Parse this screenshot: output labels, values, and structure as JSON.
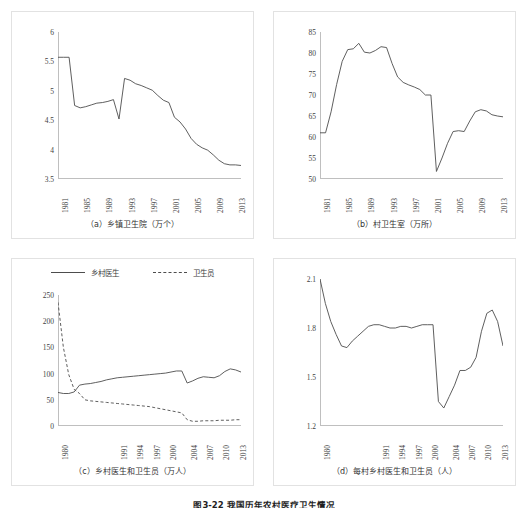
{
  "figure": {
    "caption": "图3-22  我国历年农村医疗卫生情况",
    "panels": [
      "a",
      "b",
      "c",
      "d"
    ]
  },
  "legend": {
    "entries": [
      {
        "label": "乡村医生",
        "style": "solid",
        "swatch": "solid-line-swatch"
      },
      {
        "label": "卫生员",
        "style": "dashed",
        "swatch": "dashed-line-swatch"
      }
    ]
  },
  "chart_data": [
    {
      "id": "a",
      "type": "line",
      "title": "（a）乡镇卫生院（万个）",
      "xlabel": "",
      "ylabel": "",
      "ylim": [
        3.5,
        6
      ],
      "yticks": [
        3.5,
        4,
        4.5,
        5,
        5.5,
        6
      ],
      "ytick_labels": [
        "3.5",
        "4",
        "4.5",
        "5",
        "5.5",
        "6"
      ],
      "grid": false,
      "xlim": [
        1981,
        2014
      ],
      "xticks": [
        1981,
        1985,
        1989,
        1993,
        1997,
        2001,
        2005,
        2009,
        2013
      ],
      "xtick_labels": [
        "1981",
        "1985",
        "1989",
        "1993",
        "1997",
        "2001",
        "2005",
        "2009",
        "2013"
      ],
      "x": [
        1981,
        1982,
        1983,
        1984,
        1985,
        1986,
        1987,
        1988,
        1989,
        1990,
        1991,
        1992,
        1993,
        1994,
        1995,
        1996,
        1997,
        1998,
        1999,
        2000,
        2001,
        2002,
        2003,
        2004,
        2005,
        2006,
        2007,
        2008,
        2009,
        2010,
        2011,
        2012,
        2013,
        2014
      ],
      "series": [
        {
          "name": "乡镇卫生院",
          "style": "solid",
          "values": [
            5.57,
            5.57,
            5.57,
            4.75,
            4.71,
            4.73,
            4.76,
            4.79,
            4.8,
            4.82,
            4.85,
            4.52,
            5.21,
            5.18,
            5.12,
            5.09,
            5.05,
            5.01,
            4.92,
            4.84,
            4.8,
            4.55,
            4.47,
            4.35,
            4.19,
            4.09,
            4.03,
            3.99,
            3.91,
            3.82,
            3.76,
            3.74,
            3.74,
            3.73
          ]
        }
      ]
    },
    {
      "id": "b",
      "type": "line",
      "title": "（b）村卫生室（万所）",
      "xlabel": "",
      "ylabel": "",
      "ylim": [
        50,
        85
      ],
      "yticks": [
        50,
        55,
        60,
        65,
        70,
        75,
        80,
        85
      ],
      "ytick_labels": [
        "50",
        "55",
        "60",
        "65",
        "70",
        "75",
        "80",
        "85"
      ],
      "grid": false,
      "xlim": [
        1981,
        2014
      ],
      "xticks": [
        1981,
        1985,
        1989,
        1993,
        1997,
        2001,
        2005,
        2009,
        2013
      ],
      "xtick_labels": [
        "1981",
        "1985",
        "1989",
        "1993",
        "1997",
        "2001",
        "2005",
        "2009",
        "2013"
      ],
      "x": [
        1981,
        1982,
        1983,
        1984,
        1985,
        1986,
        1987,
        1988,
        1989,
        1990,
        1991,
        1992,
        1993,
        1994,
        1995,
        1996,
        1997,
        1998,
        1999,
        2000,
        2001,
        2002,
        2003,
        2004,
        2005,
        2006,
        2007,
        2008,
        2009,
        2010,
        2011,
        2012,
        2013,
        2014
      ],
      "series": [
        {
          "name": "村卫生室",
          "style": "solid",
          "values": [
            61.0,
            61.0,
            66.0,
            72.5,
            78.0,
            80.8,
            81.0,
            82.3,
            80.2,
            80.0,
            80.6,
            81.5,
            81.3,
            77.5,
            74.3,
            73.0,
            72.4,
            71.9,
            71.3,
            70.0,
            70.0,
            51.8,
            55.0,
            58.5,
            61.3,
            61.5,
            61.3,
            63.8,
            66.0,
            66.5,
            66.2,
            65.3,
            65.0,
            64.8
          ]
        }
      ]
    },
    {
      "id": "c",
      "type": "line",
      "title": "（c）乡村医生和卫生员（万人）",
      "xlabel": "",
      "ylabel": "",
      "ylim": [
        0,
        250
      ],
      "yticks": [
        0,
        50,
        100,
        150,
        200,
        250
      ],
      "ytick_labels": [
        "0",
        "50",
        "100",
        "150",
        "200",
        "250"
      ],
      "grid": false,
      "xlim": [
        1980,
        2014
      ],
      "xticks": [
        1980,
        1991,
        1994,
        1997,
        2000,
        2004,
        2007,
        2010,
        2013
      ],
      "xtick_labels": [
        "1980",
        "1991",
        "1994",
        "1997",
        "2000",
        "2004",
        "2007",
        "2010",
        "2013"
      ],
      "x": [
        1980,
        1981,
        1982,
        1983,
        1984,
        1985,
        1986,
        1987,
        1988,
        1989,
        1990,
        1991,
        1992,
        1993,
        1994,
        1995,
        1996,
        1997,
        1998,
        1999,
        2000,
        2001,
        2002,
        2003,
        2004,
        2005,
        2006,
        2007,
        2008,
        2009,
        2010,
        2011,
        2012,
        2013,
        2014
      ],
      "series": [
        {
          "name": "乡村医生",
          "style": "solid",
          "values": [
            64,
            62,
            62,
            65,
            78,
            80,
            81,
            83,
            85,
            88,
            90,
            92,
            93,
            94,
            95,
            96,
            97,
            98,
            99,
            100,
            101,
            103,
            105,
            105,
            82,
            86,
            91,
            94,
            93,
            92,
            96,
            104,
            109,
            107,
            103
          ]
        },
        {
          "name": "卫生员",
          "style": "dashed",
          "values": [
            236,
            150,
            98,
            70,
            62,
            50,
            48,
            47,
            46,
            45,
            44,
            43,
            42,
            41,
            40,
            39,
            38,
            37,
            35,
            33,
            31,
            29,
            27,
            25,
            12,
            9,
            9,
            10,
            10,
            10,
            11,
            11,
            11,
            12,
            12
          ]
        }
      ]
    },
    {
      "id": "d",
      "type": "line",
      "title": "（d）每村乡村医生和卫生员（人）",
      "xlabel": "",
      "ylabel": "",
      "ylim": [
        1.2,
        2.1
      ],
      "yticks": [
        1.2,
        1.5,
        1.8,
        2.1
      ],
      "ytick_labels": [
        "1.2",
        "1.5",
        "1.8",
        "2.1"
      ],
      "grid": false,
      "xlim": [
        1980,
        2014
      ],
      "xticks": [
        1980,
        1991,
        1994,
        1997,
        2000,
        2004,
        2007,
        2010,
        2013
      ],
      "xtick_labels": [
        "1980",
        "1991",
        "1994",
        "1997",
        "2000",
        "2004",
        "2007",
        "2010",
        "2013"
      ],
      "x": [
        1980,
        1981,
        1982,
        1983,
        1984,
        1985,
        1986,
        1987,
        1988,
        1989,
        1990,
        1991,
        1992,
        1993,
        1994,
        1995,
        1996,
        1997,
        1998,
        1999,
        2000,
        2001,
        2002,
        2003,
        2004,
        2005,
        2006,
        2007,
        2008,
        2009,
        2010,
        2011,
        2012,
        2013,
        2014
      ],
      "series": [
        {
          "name": "每村乡村医生和卫生员",
          "style": "solid",
          "values": [
            2.1,
            1.95,
            1.84,
            1.76,
            1.69,
            1.68,
            1.72,
            1.75,
            1.78,
            1.81,
            1.82,
            1.82,
            1.81,
            1.8,
            1.8,
            1.81,
            1.81,
            1.8,
            1.81,
            1.82,
            1.82,
            1.82,
            1.35,
            1.31,
            1.38,
            1.45,
            1.54,
            1.54,
            1.56,
            1.62,
            1.78,
            1.89,
            1.91,
            1.84,
            1.69
          ]
        }
      ]
    }
  ],
  "colors": {
    "line": "#4d4d4d",
    "axis": "#bfbfbf",
    "panel_border": "#e2e2e2",
    "text": "#3f3f3f"
  }
}
